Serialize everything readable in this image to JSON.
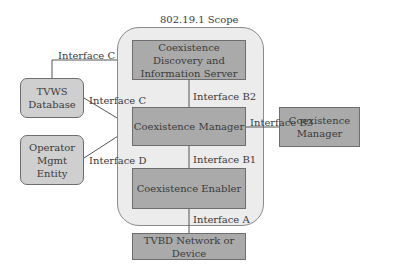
{
  "diagram": {
    "scope_title": "802.19.1 Scope",
    "nodes": {
      "cdis": "Coexistence Discovery and Information Server",
      "cm": "Coexistence Manager",
      "ce": "Coexistence Enabler",
      "tvbd": "TVBD Network or Device",
      "cm_external": "Coexistence Manager",
      "tvws_db": "TVWS Database",
      "operator": "Operator Mgmt Entity"
    },
    "interfaces": {
      "c_top": "Interface C",
      "c_mid": "Interface C",
      "d": "Interface D",
      "b2": "Interface B2",
      "b1": "Interface B1",
      "b3": "Interface B3",
      "a": "Interface A"
    },
    "colors": {
      "inner_box": "#aaaaaa",
      "scope_bg": "#ececec",
      "external_box": "#cfcfcf",
      "line": "#555555"
    }
  }
}
